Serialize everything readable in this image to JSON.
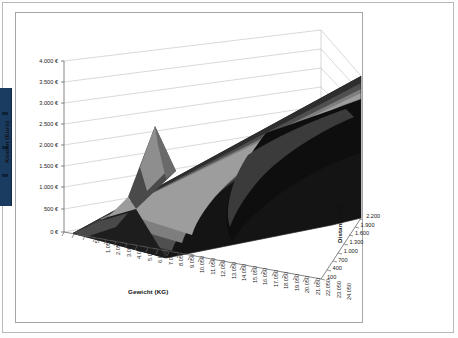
{
  "page": {
    "nav_strip_color": "#1b3c61",
    "frame_color": "#a6a6a6"
  },
  "chart_data": {
    "type": "surface",
    "title": "",
    "xlabel": "Gewicht (KG)",
    "ylabel": "Kosten (Euro)",
    "zlabel": "Distanz (KM)",
    "grid": true,
    "legend_position": "none",
    "ylim": [
      0,
      4000
    ],
    "y_ticks": [
      "0 €",
      "500 €",
      "1.000 €",
      "1.500 €",
      "2.000 €",
      "2.500 €",
      "3.000 €",
      "3.500 €",
      "4.000 €"
    ],
    "y_values": [
      0,
      500,
      1000,
      1500,
      2000,
      2500,
      3000,
      3500,
      4000
    ],
    "x_categories": [
      "50",
      "1.050",
      "2.050",
      "3.050",
      "4.050",
      "5.050",
      "6.050",
      "7.050",
      "8.050",
      "9.050",
      "10.050",
      "11.050",
      "12.050",
      "13.050",
      "14.050",
      "15.050",
      "16.050",
      "17.050",
      "18.050",
      "19.050",
      "20.050",
      "21.050",
      "22.050",
      "23.050",
      "24.050"
    ],
    "z_categories": [
      "100",
      "400",
      "700",
      "1.000",
      "1.300",
      "1.600",
      "1.900",
      "2.200"
    ],
    "band_colors": [
      "#f7f7f7",
      "#b4b4b4",
      "#8c8c8c",
      "#6b6b6b",
      "#4a4a4a",
      "#2b2b2b",
      "#111111"
    ],
    "surface_description": "Kosten steigen mit Gewicht und Distanz; Maximum an der hinteren rechten Ecke (24.050 KG / 2.200 KM) nahe 4.000 €, mit einer Zwischenspitze bei ca. 12.050 KG.",
    "series": [
      {
        "name": "100",
        "values": [
          0,
          60,
          110,
          160,
          210,
          260,
          310,
          360,
          410,
          460,
          510,
          560,
          700,
          640,
          680,
          720,
          760,
          800,
          840,
          880,
          920,
          960,
          1000,
          1040,
          1080
        ]
      },
      {
        "name": "400",
        "values": [
          20,
          110,
          200,
          280,
          360,
          440,
          520,
          600,
          680,
          760,
          840,
          920,
          1150,
          1060,
          1140,
          1220,
          1300,
          1380,
          1460,
          1540,
          1620,
          1700,
          1780,
          1860,
          1940
        ]
      },
      {
        "name": "700",
        "values": [
          40,
          160,
          280,
          400,
          510,
          620,
          730,
          840,
          950,
          1060,
          1170,
          1280,
          1560,
          1480,
          1590,
          1700,
          1810,
          1920,
          2030,
          2140,
          2250,
          2360,
          2470,
          2580,
          2690
        ]
      },
      {
        "name": "1.000",
        "values": [
          60,
          210,
          360,
          510,
          660,
          800,
          940,
          1080,
          1220,
          1360,
          1500,
          1640,
          1900,
          1900,
          2040,
          2180,
          2320,
          2460,
          2600,
          2740,
          2880,
          3020,
          3160,
          3300,
          3440
        ]
      },
      {
        "name": "1.300",
        "values": [
          80,
          250,
          420,
          590,
          760,
          930,
          1100,
          1270,
          1440,
          1610,
          1780,
          1950,
          2180,
          2220,
          2380,
          2540,
          2700,
          2860,
          3020,
          3180,
          3340,
          3500,
          3660,
          3820,
          3900
        ]
      },
      {
        "name": "1.600",
        "values": [
          100,
          290,
          480,
          670,
          860,
          1050,
          1240,
          1430,
          1620,
          1810,
          2000,
          2190,
          2400,
          2500,
          2680,
          2860,
          3040,
          3220,
          3400,
          3580,
          3760,
          3900,
          3950,
          3980,
          4000
        ]
      },
      {
        "name": "1.900",
        "values": [
          120,
          330,
          540,
          750,
          960,
          1170,
          1380,
          1590,
          1800,
          2010,
          2220,
          2430,
          2600,
          2790,
          2990,
          3190,
          3390,
          3590,
          3790,
          3900,
          3950,
          3980,
          4000,
          4000,
          4000
        ]
      },
      {
        "name": "2.200",
        "values": [
          140,
          370,
          600,
          830,
          1060,
          1290,
          1520,
          1750,
          1980,
          2210,
          2440,
          2670,
          2800,
          3080,
          3300,
          3520,
          3740,
          3900,
          3960,
          4000,
          4000,
          4000,
          4000,
          4000,
          4000
        ]
      }
    ]
  }
}
